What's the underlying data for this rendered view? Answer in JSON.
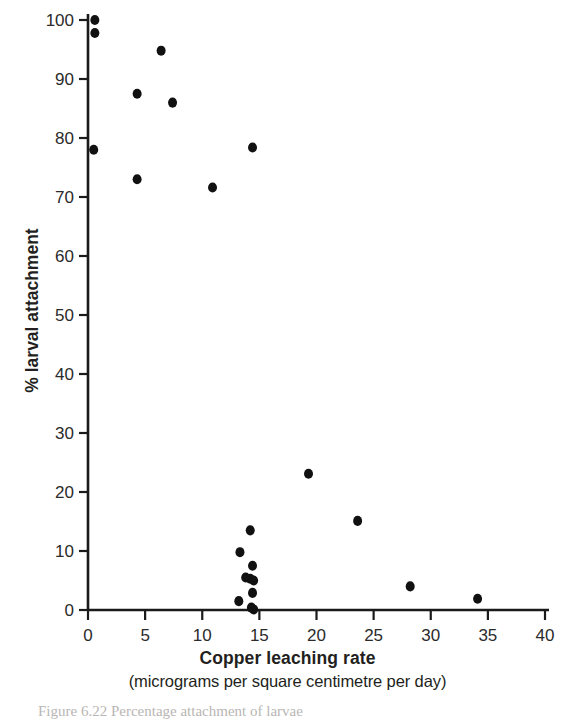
{
  "figure": {
    "caption_partial": "Figure 6.22  Percentage attachment of larvae"
  },
  "chart_data": {
    "type": "scatter",
    "title": "",
    "xlabel": "Copper leaching rate",
    "xlabel_units": "(micrograms per square centimetre per day)",
    "ylabel": "% larval attachment",
    "xlim": [
      0,
      40
    ],
    "ylim": [
      0,
      100
    ],
    "xticks": [
      0,
      5,
      10,
      15,
      20,
      25,
      30,
      35,
      40
    ],
    "xtick_labels": [
      "0",
      "5",
      "10",
      "15",
      "20",
      "25",
      "30",
      "35",
      "40"
    ],
    "yticks": [
      0,
      10,
      20,
      30,
      40,
      50,
      60,
      70,
      80,
      90,
      100
    ],
    "ytick_labels": [
      "0",
      "10",
      "20",
      "30",
      "40",
      "50",
      "60",
      "70",
      "80",
      "90",
      "100"
    ],
    "grid": false,
    "legend": false,
    "marker": "filled-circle",
    "marker_color": "#111111",
    "marker_size_px": 9,
    "points": [
      {
        "x": 0.6,
        "y": 100.0
      },
      {
        "x": 0.6,
        "y": 97.8
      },
      {
        "x": 6.4,
        "y": 94.8
      },
      {
        "x": 4.3,
        "y": 87.5
      },
      {
        "x": 7.4,
        "y": 86.0
      },
      {
        "x": 14.4,
        "y": 78.4
      },
      {
        "x": 0.5,
        "y": 78.0
      },
      {
        "x": 4.3,
        "y": 73.0
      },
      {
        "x": 10.9,
        "y": 71.6
      },
      {
        "x": 19.3,
        "y": 23.1
      },
      {
        "x": 23.6,
        "y": 15.1
      },
      {
        "x": 14.2,
        "y": 13.5
      },
      {
        "x": 13.3,
        "y": 9.8
      },
      {
        "x": 14.4,
        "y": 7.5
      },
      {
        "x": 13.8,
        "y": 5.5
      },
      {
        "x": 14.2,
        "y": 5.3
      },
      {
        "x": 14.5,
        "y": 5.0
      },
      {
        "x": 14.4,
        "y": 2.9
      },
      {
        "x": 13.2,
        "y": 1.5
      },
      {
        "x": 14.3,
        "y": 0.4
      },
      {
        "x": 14.5,
        "y": 0.1
      },
      {
        "x": 28.2,
        "y": 4.0
      },
      {
        "x": 34.1,
        "y": 1.9
      }
    ]
  }
}
